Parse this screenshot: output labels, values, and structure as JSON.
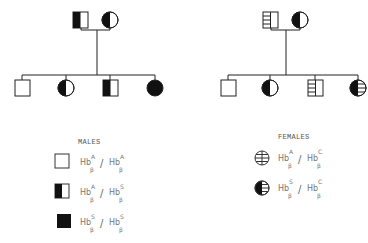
{
  "pedigrees": [
    {
      "name": "family-1",
      "parents": [
        {
          "sex": "male",
          "genotype": "HbA/HbS",
          "symbol": "square-left-filled"
        },
        {
          "sex": "female",
          "genotype": "HbA/HbS",
          "symbol": "circle-left-filled"
        }
      ],
      "children": [
        {
          "sex": "male",
          "genotype": "HbA/HbA",
          "symbol": "square-empty"
        },
        {
          "sex": "female",
          "genotype": "HbA/HbS",
          "symbol": "circle-left-filled"
        },
        {
          "sex": "male",
          "genotype": "HbA/HbS",
          "symbol": "square-left-filled"
        },
        {
          "sex": "female",
          "genotype": "HbS/HbS",
          "symbol": "circle-filled"
        }
      ]
    },
    {
      "name": "family-2",
      "parents": [
        {
          "sex": "male",
          "genotype": "HbA/HbC",
          "symbol": "square-left-striped"
        },
        {
          "sex": "female",
          "genotype": "HbA/HbS",
          "symbol": "circle-left-filled"
        }
      ],
      "children": [
        {
          "sex": "male",
          "genotype": "HbA/HbA",
          "symbol": "square-empty"
        },
        {
          "sex": "female",
          "genotype": "HbA/HbS",
          "symbol": "circle-left-filled"
        },
        {
          "sex": "male",
          "genotype": "HbA/HbC",
          "symbol": "square-left-striped"
        },
        {
          "sex": "female",
          "genotype": "HbS/HbC",
          "symbol": "circle-left-filled-right-striped"
        }
      ]
    }
  ],
  "legend": {
    "males": {
      "title": "MALES",
      "entries": [
        {
          "symbol": "square-empty",
          "a1": "A",
          "a2": "A"
        },
        {
          "symbol": "square-left-filled",
          "a1": "A",
          "a2": "S"
        },
        {
          "symbol": "square-filled",
          "a1": "S",
          "a2": "S"
        }
      ]
    },
    "females": {
      "title": "FEMALES",
      "entries": [
        {
          "symbol": "circle-striped",
          "a1": "A",
          "a2": "C"
        },
        {
          "symbol": "circle-left-filled-right-striped",
          "a1": "S",
          "a2": "C"
        }
      ]
    },
    "hb": "Hb",
    "beta": "β",
    "slash": "/"
  }
}
